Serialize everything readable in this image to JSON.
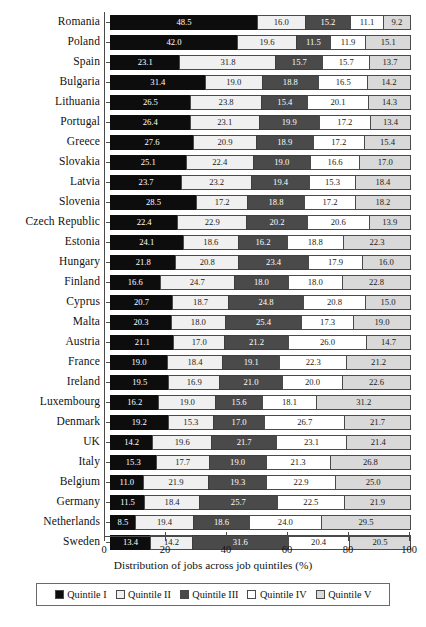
{
  "chart_data": {
    "type": "bar",
    "orientation": "horizontal",
    "stacked": true,
    "normalized_percent": true,
    "title": "",
    "xlabel": "Distribution of jobs across job quintiles (%)",
    "ylabel": "",
    "xlim": [
      0,
      100
    ],
    "xticks": [
      0,
      20,
      40,
      60,
      80,
      100
    ],
    "xticklabels": [
      "0",
      "20",
      "40",
      "60",
      "80",
      "100"
    ],
    "grid": false,
    "legend_position": "bottom",
    "legend_boxed": true,
    "series": [
      {
        "name": "Quintile I",
        "color": "#0d0d0d",
        "values": [
          48.5,
          42.0,
          23.1,
          31.4,
          26.5,
          26.4,
          27.6,
          25.1,
          23.7,
          28.5,
          22.4,
          24.1,
          21.8,
          16.6,
          20.7,
          20.3,
          21.1,
          19.0,
          19.5,
          16.2,
          19.2,
          14.2,
          15.3,
          11.0,
          11.5,
          8.5,
          13.4
        ]
      },
      {
        "name": "Quintile II",
        "color": "#f0f0f0",
        "values": [
          16.0,
          19.6,
          31.8,
          19.0,
          23.8,
          23.1,
          20.9,
          22.4,
          23.2,
          17.2,
          22.9,
          18.6,
          20.8,
          24.7,
          18.7,
          18.0,
          17.0,
          18.4,
          16.9,
          19.0,
          15.3,
          19.6,
          17.7,
          21.9,
          18.4,
          19.4,
          14.2
        ]
      },
      {
        "name": "Quintile III",
        "color": "#4a4a4a",
        "values": [
          15.2,
          11.5,
          15.7,
          18.8,
          15.4,
          19.9,
          18.9,
          19.0,
          19.4,
          18.8,
          20.2,
          16.2,
          23.4,
          18.0,
          24.8,
          25.4,
          21.2,
          19.1,
          21.0,
          15.6,
          17.0,
          21.7,
          19.0,
          19.3,
          25.7,
          18.6,
          31.6
        ]
      },
      {
        "name": "Quintile IV",
        "color": "#ffffff",
        "values": [
          11.1,
          11.9,
          15.7,
          16.5,
          20.1,
          17.2,
          17.2,
          16.6,
          15.3,
          17.2,
          20.6,
          18.8,
          17.9,
          18.0,
          20.8,
          17.3,
          26.0,
          22.3,
          20.0,
          18.1,
          26.7,
          23.1,
          21.3,
          22.9,
          22.5,
          24.0,
          20.4
        ]
      },
      {
        "name": "Quintile V",
        "color": "#d9d9d9",
        "values": [
          9.2,
          15.1,
          13.7,
          14.2,
          14.3,
          13.4,
          15.4,
          17.0,
          18.4,
          18.2,
          13.9,
          22.3,
          16.0,
          22.8,
          15.0,
          19.0,
          14.7,
          21.2,
          22.6,
          31.2,
          21.7,
          21.4,
          26.8,
          25.0,
          21.9,
          29.5,
          20.5
        ]
      }
    ],
    "categories": [
      "Romania",
      "Poland",
      "Spain",
      "Bulgaria",
      "Lithuania",
      "Portugal",
      "Greece",
      "Slovakia",
      "Latvia",
      "Slovenia",
      "Czech Republic",
      "Estonia",
      "Hungary",
      "Finland",
      "Cyprus",
      "Malta",
      "Austria",
      "France",
      "Ireland",
      "Luxembourg",
      "Denmark",
      "UK",
      "Italy",
      "Belgium",
      "Germany",
      "Netherlands",
      "Sweden"
    ],
    "rows": [
      {
        "category": "Romania",
        "values": [
          48.5,
          16.0,
          15.2,
          11.1,
          9.2
        ]
      },
      {
        "category": "Poland",
        "values": [
          42.0,
          19.6,
          11.5,
          11.9,
          15.1
        ]
      },
      {
        "category": "Spain",
        "values": [
          23.1,
          31.8,
          15.7,
          15.7,
          13.7
        ]
      },
      {
        "category": "Bulgaria",
        "values": [
          31.4,
          19.0,
          18.8,
          16.5,
          14.2
        ]
      },
      {
        "category": "Lithuania",
        "values": [
          26.5,
          23.8,
          15.4,
          20.1,
          14.3
        ]
      },
      {
        "category": "Portugal",
        "values": [
          26.4,
          23.1,
          19.9,
          17.2,
          13.4
        ]
      },
      {
        "category": "Greece",
        "values": [
          27.6,
          20.9,
          18.9,
          17.2,
          15.4
        ]
      },
      {
        "category": "Slovakia",
        "values": [
          25.1,
          22.4,
          19.0,
          16.6,
          17.0
        ]
      },
      {
        "category": "Latvia",
        "values": [
          23.7,
          23.2,
          19.4,
          15.3,
          18.4
        ]
      },
      {
        "category": "Slovenia",
        "values": [
          28.5,
          17.2,
          18.8,
          17.2,
          18.2
        ]
      },
      {
        "category": "Czech Republic",
        "values": [
          22.4,
          22.9,
          20.2,
          20.6,
          13.9
        ]
      },
      {
        "category": "Estonia",
        "values": [
          24.1,
          18.6,
          16.2,
          18.8,
          22.3
        ]
      },
      {
        "category": "Hungary",
        "values": [
          21.8,
          20.8,
          23.4,
          17.9,
          16.0
        ]
      },
      {
        "category": "Finland",
        "values": [
          16.6,
          24.7,
          18.0,
          18.0,
          22.8
        ]
      },
      {
        "category": "Cyprus",
        "values": [
          20.7,
          18.7,
          24.8,
          20.8,
          15.0
        ]
      },
      {
        "category": "Malta",
        "values": [
          20.3,
          18.0,
          25.4,
          17.3,
          19.0
        ]
      },
      {
        "category": "Austria",
        "values": [
          21.1,
          17.0,
          21.2,
          26.0,
          14.7
        ]
      },
      {
        "category": "France",
        "values": [
          19.0,
          18.4,
          19.1,
          22.3,
          21.2
        ]
      },
      {
        "category": "Ireland",
        "values": [
          19.5,
          16.9,
          21.0,
          20.0,
          22.6
        ]
      },
      {
        "category": "Luxembourg",
        "values": [
          16.2,
          19.0,
          15.6,
          18.1,
          31.2
        ]
      },
      {
        "category": "Denmark",
        "values": [
          19.2,
          15.3,
          17.0,
          26.7,
          21.7
        ]
      },
      {
        "category": "UK",
        "values": [
          14.2,
          19.6,
          21.7,
          23.1,
          21.4
        ]
      },
      {
        "category": "Italy",
        "values": [
          15.3,
          17.7,
          19.0,
          21.3,
          26.8
        ]
      },
      {
        "category": "Belgium",
        "values": [
          11.0,
          21.9,
          19.3,
          22.9,
          25.0
        ]
      },
      {
        "category": "Germany",
        "values": [
          11.5,
          18.4,
          25.7,
          22.5,
          21.9
        ]
      },
      {
        "category": "Netherlands",
        "values": [
          8.5,
          19.4,
          18.6,
          24.0,
          29.5
        ]
      },
      {
        "category": "Sweden",
        "values": [
          13.4,
          14.2,
          31.6,
          20.4,
          20.5
        ]
      }
    ]
  },
  "legend": {
    "items": [
      {
        "label": "Quintile I",
        "color": "#0d0d0d"
      },
      {
        "label": "Quintile II",
        "color": "#f0f0f0"
      },
      {
        "label": "Quintile III",
        "color": "#4a4a4a"
      },
      {
        "label": "Quintile IV",
        "color": "#ffffff"
      },
      {
        "label": "Quintile V",
        "color": "#d9d9d9"
      }
    ]
  },
  "axis": {
    "xlabel": "Distribution of jobs across job quintiles (%)",
    "ticks": [
      "0",
      "20",
      "40",
      "60",
      "80",
      "100"
    ]
  },
  "caption": ""
}
